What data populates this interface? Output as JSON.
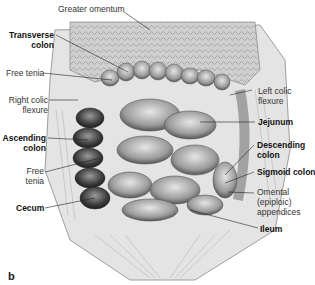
{
  "figure": {
    "panel_letter": "b"
  },
  "labels": {
    "greater_omentum": "Greater omentum",
    "transverse_colon_1": "Transverse",
    "transverse_colon_2": "colon",
    "free_tenia_top": "Free tenia",
    "right_colic_flexure_1": "Right colic",
    "right_colic_flexure_2": "flexure",
    "ascending_colon_1": "Ascending",
    "ascending_colon_2": "colon",
    "free_tenia_mid_1": "Free",
    "free_tenia_mid_2": "tenia",
    "cecum": "Cecum",
    "left_colic_flexure_1": "Left colic",
    "left_colic_flexure_2": "flexure",
    "jejunum": "Jejunum",
    "descending_colon_1": "Descending",
    "descending_colon_2": "colon",
    "sigmoid_colon": "Sigmoid colon",
    "omental_appendices_1": "Omental",
    "omental_appendices_2": "(epiploic)",
    "omental_appendices_3": "appendices",
    "ileum": "Ileum"
  }
}
